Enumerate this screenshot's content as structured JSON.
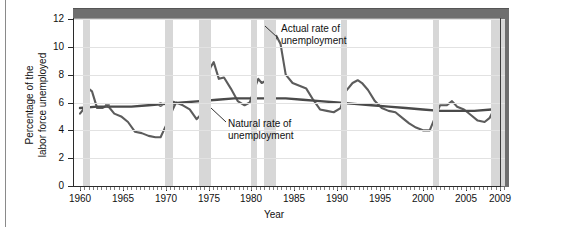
{
  "figure": {
    "axis_title_x": "Year",
    "axis_title_y": "Percentage of the\nlabor force unemployed"
  },
  "annotations": {
    "actual": "Actual rate of\nunemployment",
    "natural": "Natural rate of\nunemployment"
  },
  "colors": {
    "recession_band": "#d7d7d7",
    "actual_line": "#5c5c5c",
    "natural_line": "#4a4a4a",
    "frame_bar": "#6e6e6e",
    "gridline": "#e2e2e2",
    "axis": "#2b2b2b",
    "background": "#ffffff"
  },
  "chart_data": {
    "type": "line",
    "title": "",
    "xlabel": "Year",
    "ylabel": "Percentage of the labor force unemployed",
    "xlim": [
      1960,
      2009.6
    ],
    "ylim": [
      0,
      12
    ],
    "yticks": [
      0,
      2,
      4,
      6,
      8,
      10,
      12
    ],
    "xticks": [
      1960,
      1965,
      1970,
      1975,
      1980,
      1985,
      1990,
      1995,
      2000,
      2005,
      2009
    ],
    "xtick_labels": [
      "1960",
      "1965",
      "1970",
      "1975",
      "1980",
      "1985",
      "1990",
      "1995",
      "2000",
      "2005",
      "2009"
    ],
    "ytick_labels": [
      "0",
      "2",
      "4",
      "6",
      "8",
      "10",
      "12"
    ],
    "grid": "horizontal",
    "legend": "annotations-inline",
    "recessions": [
      {
        "label": "1960-61",
        "start": 1960.3,
        "end": 1961.2
      },
      {
        "label": "1969-70",
        "start": 1969.9,
        "end": 1970.9
      },
      {
        "label": "1973-75",
        "start": 1973.9,
        "end": 1975.3
      },
      {
        "label": "1980",
        "start": 1980.0,
        "end": 1980.6
      },
      {
        "label": "1981-82",
        "start": 1981.5,
        "end": 1982.9
      },
      {
        "label": "1990-91",
        "start": 1990.5,
        "end": 1991.2
      },
      {
        "label": "2001",
        "start": 2001.2,
        "end": 2001.9
      },
      {
        "label": "2007-09",
        "start": 2007.9,
        "end": 2009.6
      }
    ],
    "series": [
      {
        "name": "Actual rate of unemployment",
        "x": [
          1960.0,
          1960.5,
          1961.0,
          1961.4,
          1962.0,
          1962.6,
          1963.2,
          1964.0,
          1964.8,
          1965.6,
          1966.4,
          1967.2,
          1968.0,
          1968.8,
          1969.4,
          1970.0,
          1970.6,
          1971.2,
          1972.0,
          1972.8,
          1973.6,
          1974.2,
          1974.8,
          1975.2,
          1975.6,
          1976.2,
          1976.8,
          1977.6,
          1978.4,
          1979.2,
          1979.8,
          1980.3,
          1980.8,
          1981.2,
          1981.8,
          1982.3,
          1982.9,
          1983.4,
          1984.0,
          1984.8,
          1985.6,
          1986.4,
          1987.2,
          1988.0,
          1988.8,
          1989.6,
          1990.4,
          1991.0,
          1991.8,
          1992.4,
          1992.9,
          1993.6,
          1994.4,
          1995.2,
          1996.0,
          1996.8,
          1997.6,
          1998.4,
          1999.2,
          2000.0,
          2000.8,
          2001.4,
          2002.0,
          2002.8,
          2003.4,
          2004.0,
          2004.8,
          2005.6,
          2006.4,
          2007.2,
          2007.8,
          2008.2,
          2008.6,
          2009.0,
          2009.4
        ],
        "y": [
          5.2,
          5.6,
          7.0,
          6.8,
          5.6,
          5.6,
          5.8,
          5.2,
          5.0,
          4.6,
          3.9,
          3.8,
          3.6,
          3.5,
          3.5,
          4.3,
          5.2,
          6.0,
          5.8,
          5.5,
          4.8,
          5.2,
          6.6,
          8.5,
          8.9,
          7.7,
          7.8,
          7.0,
          6.1,
          5.8,
          6.0,
          6.9,
          7.7,
          7.4,
          7.6,
          9.4,
          10.8,
          10.2,
          8.0,
          7.4,
          7.2,
          7.0,
          6.2,
          5.5,
          5.4,
          5.3,
          5.6,
          6.8,
          7.4,
          7.6,
          7.4,
          6.9,
          6.1,
          5.6,
          5.4,
          5.3,
          4.9,
          4.5,
          4.2,
          4.0,
          4.0,
          4.9,
          5.8,
          5.8,
          6.1,
          5.7,
          5.5,
          5.1,
          4.7,
          4.6,
          4.9,
          5.4,
          6.2,
          8.3,
          9.7
        ]
      },
      {
        "name": "Natural rate of unemployment",
        "x": [
          1960,
          1962,
          1964,
          1966,
          1968,
          1970,
          1972,
          1974,
          1976,
          1978,
          1980,
          1982,
          1984,
          1986,
          1988,
          1990,
          1992,
          1994,
          1996,
          1998,
          2000,
          2002,
          2004,
          2006,
          2008,
          2009.5
        ],
        "y": [
          5.6,
          5.7,
          5.7,
          5.7,
          5.8,
          5.9,
          6.0,
          6.1,
          6.2,
          6.3,
          6.3,
          6.3,
          6.3,
          6.2,
          6.1,
          6.0,
          5.9,
          5.8,
          5.7,
          5.6,
          5.5,
          5.4,
          5.4,
          5.4,
          5.5,
          5.5
        ]
      }
    ],
    "series_markers": [
      {
        "x": 1963.2,
        "y": 5.8
      },
      {
        "x": 1969.4,
        "y": 5.85
      },
      {
        "x": 1970.9,
        "y": 5.95
      }
    ]
  }
}
